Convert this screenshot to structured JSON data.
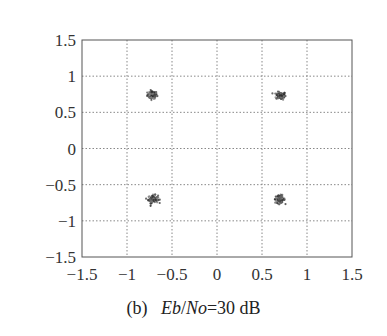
{
  "chart_data": {
    "type": "scatter",
    "title": "",
    "subtitle": "(b) Eb/No=30 dB",
    "xlabel": "",
    "ylabel": "",
    "xlim": [
      -1.5,
      1.5
    ],
    "ylim": [
      -1.5,
      1.5
    ],
    "grid": true,
    "grid_style": "dotted",
    "legend": null,
    "xticks": [
      -1.5,
      -1,
      -0.5,
      0,
      0.5,
      1,
      1.5
    ],
    "yticks": [
      -1.5,
      -1,
      -0.5,
      0,
      0.5,
      1,
      1.5
    ],
    "xtick_labels": [
      "−1.5",
      "−1",
      "−0.5",
      "0",
      "0.5",
      "1",
      "1.5"
    ],
    "ytick_labels": [
      "−1.5",
      "−1",
      "−0.5",
      "0",
      "0.5",
      "1",
      "1.5"
    ],
    "series": [
      {
        "name": "QPSK received constellation",
        "description": "Four tight clusters of noisy received symbols",
        "clusters": [
          {
            "x": -0.72,
            "y": 0.74,
            "spread": 0.06
          },
          {
            "x": 0.71,
            "y": 0.73,
            "spread": 0.06
          },
          {
            "x": -0.71,
            "y": -0.7,
            "spread": 0.06
          },
          {
            "x": 0.7,
            "y": -0.7,
            "spread": 0.06
          }
        ]
      }
    ]
  },
  "caption": {
    "label": "(b)",
    "eb": "Eb",
    "slash": "/",
    "no": "No",
    "rest": "=30 dB"
  }
}
